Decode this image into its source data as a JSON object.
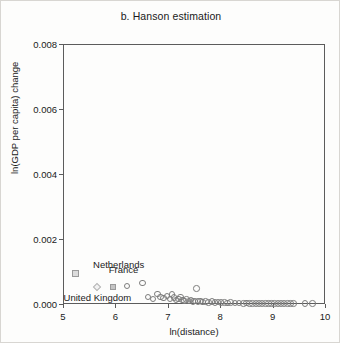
{
  "figure": {
    "title": "b. Hanson estimation",
    "background_color": "#fdfdfc",
    "axis_color": "#5c5c5c",
    "marker_color": "#7d7d7d"
  },
  "chart_data": {
    "type": "scatter",
    "title": "b. Hanson estimation",
    "xlabel": "ln(distance)",
    "ylabel": "ln(GDP per capita) change",
    "xlim": [
      5,
      10
    ],
    "ylim": [
      0,
      0.008
    ],
    "xticks": [
      "5",
      "6",
      "7",
      "8",
      "9",
      "10"
    ],
    "xtick_values": [
      5,
      6,
      7,
      8,
      9,
      10
    ],
    "yticks": [
      "0.000",
      "0.002",
      "0.004",
      "0.006",
      "0.008"
    ],
    "ytick_values": [
      0.0,
      0.002,
      0.004,
      0.006,
      0.008
    ],
    "grid": false,
    "legend": "none",
    "annotations": [
      {
        "label": "Netherlands",
        "x": 5.65,
        "y": 0.00108,
        "marker": "diamond"
      },
      {
        "label": "France",
        "x": 5.95,
        "y": 0.00092,
        "marker": "square"
      },
      {
        "label": "United Kingdom",
        "x": 5.05,
        "y": 5e-05,
        "marker": "none"
      }
    ],
    "series": [
      {
        "name": "Netherlands",
        "marker": "diamond",
        "points": [
          [
            5.64,
            0.00052
          ]
        ]
      },
      {
        "name": "France",
        "marker": "square",
        "points": [
          [
            5.95,
            0.00052
          ]
        ]
      },
      {
        "name": "Other countries",
        "marker": "circle",
        "points": [
          [
            6.22,
            0.00055
          ],
          [
            6.52,
            0.00064
          ],
          [
            6.62,
            0.00022
          ],
          [
            6.72,
            0.00016
          ],
          [
            6.8,
            0.00031
          ],
          [
            6.86,
            0.00022
          ],
          [
            6.92,
            0.00018
          ],
          [
            6.98,
            0.00025
          ],
          [
            7.04,
            0.00016
          ],
          [
            7.08,
            0.00029
          ],
          [
            7.12,
            0.0002
          ],
          [
            7.16,
            0.00012
          ],
          [
            7.2,
            0.00016
          ],
          [
            7.24,
            0.00021
          ],
          [
            7.28,
            0.00013
          ],
          [
            7.32,
            0.0001
          ],
          [
            7.36,
            0.00014
          ],
          [
            7.4,
            9e-05
          ],
          [
            7.44,
            0.00012
          ],
          [
            7.48,
            8e-05
          ],
          [
            7.52,
            0.0001
          ],
          [
            7.55,
            0.00047
          ],
          [
            7.58,
            7e-05
          ],
          [
            7.62,
            9e-05
          ],
          [
            7.66,
            6e-05
          ],
          [
            7.72,
            8e-05
          ],
          [
            7.78,
            5e-05
          ],
          [
            7.84,
            7e-05
          ],
          [
            7.9,
            4e-05
          ],
          [
            7.96,
            6e-05
          ],
          [
            8.02,
            4e-05
          ],
          [
            8.08,
            5e-05
          ],
          [
            8.14,
            3e-05
          ],
          [
            8.2,
            4e-05
          ],
          [
            8.28,
            3e-05
          ],
          [
            8.36,
            3e-05
          ],
          [
            8.44,
            2e-05
          ],
          [
            8.5,
            3e-05
          ],
          [
            8.56,
            2e-05
          ],
          [
            8.62,
            2e-05
          ],
          [
            8.68,
            2e-05
          ],
          [
            8.74,
            2e-05
          ],
          [
            8.8,
            2e-05
          ],
          [
            8.86,
            2e-05
          ],
          [
            8.92,
            1e-05
          ],
          [
            8.98,
            2e-05
          ],
          [
            9.04,
            1e-05
          ],
          [
            9.1,
            1e-05
          ],
          [
            9.16,
            1e-05
          ],
          [
            9.22,
            1e-05
          ],
          [
            9.28,
            1e-05
          ],
          [
            9.34,
            1e-05
          ],
          [
            9.4,
            1e-05
          ],
          [
            9.62,
            1e-05
          ],
          [
            9.76,
            1e-05
          ]
        ]
      }
    ]
  }
}
